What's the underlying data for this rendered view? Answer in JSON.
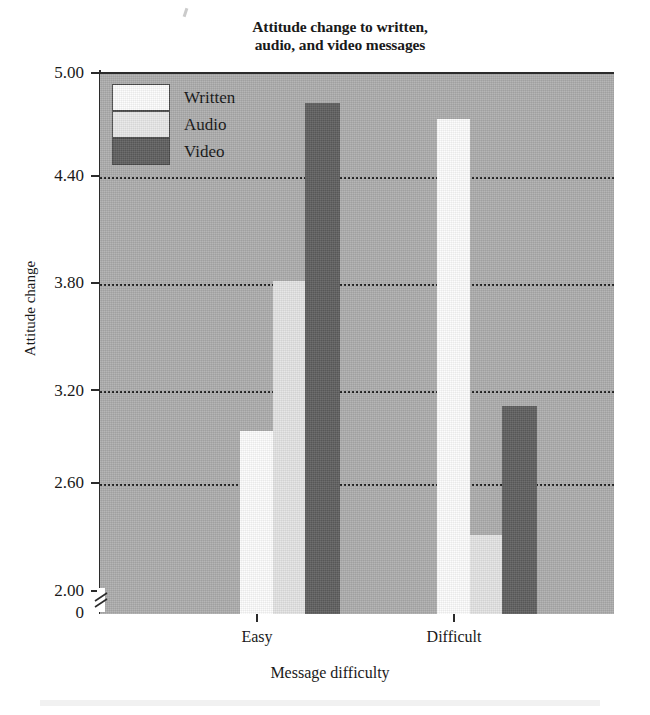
{
  "chart_data": {
    "type": "bar",
    "title": "Attitude change to written, audio, and video messages",
    "title_line1": "Attitude change to written,",
    "title_line2": "audio, and video messages",
    "xlabel": "Message difficulty",
    "ylabel": "Attitude change",
    "categories": [
      "Easy",
      "Difficult"
    ],
    "series": [
      {
        "name": "Written",
        "color": "#fdfdfd",
        "values": [
          2.93,
          4.74
        ]
      },
      {
        "name": "Audio",
        "color": "#e4e4e4",
        "values": [
          3.8,
          2.33
        ]
      },
      {
        "name": "Video",
        "color": "#5e5e5e",
        "values": [
          4.83,
          3.08
        ]
      }
    ],
    "ylim": [
      2.0,
      5.0
    ],
    "y_axis_break": true,
    "y_zero_label": "0",
    "yticks": [
      5.0,
      4.4,
      3.8,
      3.2,
      2.6,
      2.0
    ],
    "ytick_labels": [
      "5.00",
      "4.40",
      "3.80",
      "3.20",
      "2.60",
      "2.00"
    ],
    "grid": true,
    "grid_style": "dotted",
    "legend_position": "top-left-inside",
    "plot_background": "#adadad"
  },
  "legend": {
    "items": [
      {
        "label": "Written",
        "swatch": "written"
      },
      {
        "label": "Audio",
        "swatch": "audio"
      },
      {
        "label": "Video",
        "swatch": "video"
      }
    ]
  }
}
